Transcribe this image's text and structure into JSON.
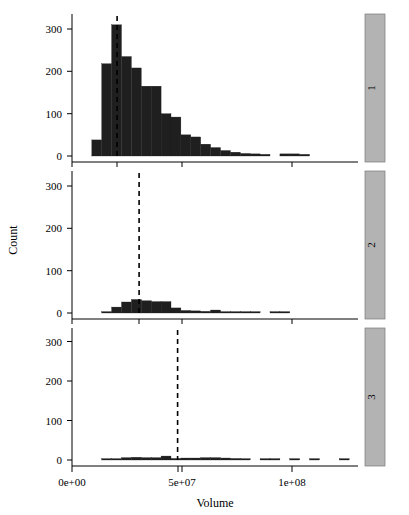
{
  "chart_data": {
    "type": "bar",
    "title": "",
    "subtitle": "",
    "xlabel": "Volume",
    "ylabel": "Count",
    "grid": false,
    "legend_position": "none",
    "layout": "3 stacked trellis panels sharing x and y axes",
    "xlim": [
      0,
      133000000
    ],
    "ylim": [
      0,
      330
    ],
    "x_ticks": [
      0,
      50000000,
      100000000
    ],
    "x_tick_labels": [
      "0e+00",
      "5e+07",
      "1e+08"
    ],
    "y_ticks": [
      0,
      100,
      200,
      300
    ],
    "y_tick_labels": [
      "0",
      "100",
      "200",
      "300"
    ],
    "bin_width": 4500000,
    "panels": [
      {
        "strip_label": "1",
        "mean_line_x": 20500000,
        "bin_starts": [
          9000000,
          13500000,
          18000000,
          22500000,
          27000000,
          31500000,
          36000000,
          40500000,
          45000000,
          49500000,
          54000000,
          58500000,
          63000000,
          67500000,
          72000000,
          76500000,
          81000000,
          85500000,
          90000000,
          94500000,
          99000000,
          103500000,
          108000000
        ],
        "values": [
          38,
          218,
          310,
          235,
          208,
          165,
          165,
          100,
          92,
          50,
          45,
          28,
          20,
          13,
          9,
          6,
          5,
          4,
          0,
          5,
          5,
          4,
          0
        ]
      },
      {
        "strip_label": "2",
        "mean_line_x": 30500000,
        "bin_starts": [
          13500000,
          18000000,
          22500000,
          27000000,
          31500000,
          36000000,
          40500000,
          45000000,
          49500000,
          54000000,
          58500000,
          63000000,
          67500000,
          72000000,
          76500000,
          81000000,
          85500000,
          90000000,
          94500000,
          99000000,
          103500000
        ],
        "values": [
          3,
          14,
          26,
          32,
          29,
          27,
          27,
          12,
          6,
          5,
          4,
          7,
          3,
          2,
          2,
          2,
          0,
          3,
          3,
          0,
          0
        ]
      },
      {
        "strip_label": "3",
        "mean_line_x": 48000000,
        "bin_starts": [
          13500000,
          18000000,
          22500000,
          27000000,
          31500000,
          36000000,
          40500000,
          45000000,
          49500000,
          54000000,
          58500000,
          63000000,
          67500000,
          72000000,
          76500000,
          81000000,
          85500000,
          90000000,
          94500000,
          99000000,
          103500000,
          108000000,
          112500000,
          117000000,
          121500000,
          126000000
        ],
        "values": [
          2,
          3,
          6,
          7,
          6,
          6,
          10,
          4,
          5,
          5,
          6,
          6,
          5,
          4,
          2,
          0,
          3,
          2,
          0,
          2,
          0,
          2,
          0,
          0,
          2,
          0
        ]
      }
    ]
  },
  "axes": {
    "x_title": "Volume",
    "y_title": "Count"
  }
}
